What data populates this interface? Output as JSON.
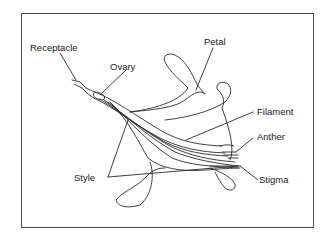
{
  "diagram": {
    "labels": {
      "receptacle": "Receptacle",
      "ovary": "Ovary",
      "petal": "Petal",
      "filament": "Filament",
      "anther": "Anther",
      "style": "Style",
      "stigma": "Stigma"
    },
    "colors": {
      "line": "#2a2a2a",
      "frame": "#4a4a4a",
      "background": "#ffffff"
    }
  }
}
